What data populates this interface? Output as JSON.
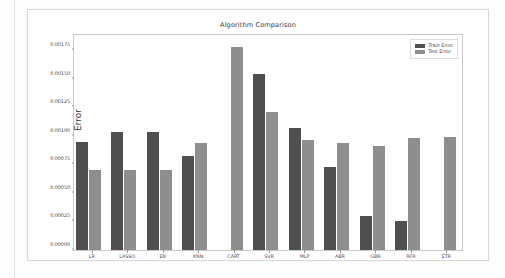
{
  "figure": {
    "title": "Algorithm Comparison"
  },
  "legend": {
    "position": "upper-right",
    "entries": [
      {
        "label": "Train Error",
        "color": "#4f4f4f"
      },
      {
        "label": "Test Error",
        "color": "#8e8e8e"
      }
    ]
  },
  "axes": {
    "ylabel": "Error",
    "xlabel": "",
    "yticks": [
      "0.00000",
      "0.00025",
      "0.00050",
      "0.00075",
      "0.00100",
      "0.00125",
      "0.00150",
      "0.00175"
    ],
    "ytick_values": [
      0.0,
      0.00025,
      0.0005,
      0.00075,
      0.001,
      0.00125,
      0.0015,
      0.00175
    ],
    "ylim": [
      0.0,
      0.0019
    ],
    "grid": false
  },
  "chart_data": {
    "type": "bar",
    "title": "Algorithm Comparison",
    "xlabel": "",
    "ylabel": "Error",
    "ylim": [
      0.0,
      0.0019
    ],
    "grid": false,
    "legend_position": "upper-right",
    "categories": [
      "LR",
      "LASSO",
      "EN",
      "KNN",
      "CART",
      "SVR",
      "MLP",
      "ABR",
      "GBR",
      "RFR",
      "ETR"
    ],
    "series": [
      {
        "name": "Train Error",
        "color": "#4f4f4f",
        "values": [
          0.00095,
          0.00103,
          0.00103,
          0.00082,
          0.0,
          0.00154,
          0.00107,
          0.00073,
          0.0003,
          0.00025,
          0.0
        ]
      },
      {
        "name": "Test Error",
        "color": "#8e8e8e",
        "values": [
          0.0007,
          0.0007,
          0.0007,
          0.00094,
          0.00178,
          0.00121,
          0.00096,
          0.00094,
          0.00091,
          0.00098,
          0.00099
        ]
      }
    ]
  }
}
